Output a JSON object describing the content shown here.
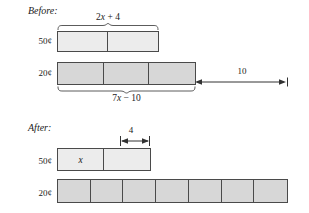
{
  "diagram": {
    "title_before": "Before:",
    "title_after": "After:",
    "before": {
      "row_50": {
        "coin_label": "50¢",
        "brace_label": "2x + 4",
        "cells": [
          "",
          ""
        ],
        "fill": "#ececec"
      },
      "row_20": {
        "coin_label": "20¢",
        "brace_label": "7x − 10",
        "cells": [
          "",
          "",
          ""
        ],
        "fill": "#d7d7d7"
      },
      "gap_dimension": "10"
    },
    "after": {
      "row_50": {
        "coin_label": "50¢",
        "cells": [
          "x",
          ""
        ],
        "fill": "#ececec",
        "dimension": "4"
      },
      "row_20": {
        "coin_label": "20¢",
        "cells": [
          "",
          "",
          "",
          "",
          "",
          "",
          ""
        ],
        "fill": "#d7d7d7"
      }
    },
    "colors": {
      "stroke": "#4a4a4a",
      "text": "#1a1a1a",
      "light_fill": "#ececec",
      "dark_fill": "#d7d7d7",
      "background": "#ffffff"
    }
  }
}
